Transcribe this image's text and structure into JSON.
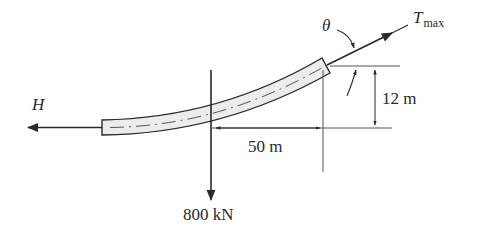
{
  "figure": {
    "type": "free-body diagram of suspended cable segment",
    "colors": {
      "line": "#2a2a2a",
      "cable_fill": "#ececec"
    }
  },
  "labels": {
    "horizontal_force": "H",
    "tension_main": "T",
    "tension_sub": "max",
    "angle": "θ",
    "weight": "800 kN",
    "horizontal_span": "50 m",
    "vertical_rise": "12 m"
  },
  "forces": [
    {
      "name": "H",
      "direction": "left",
      "description": "horizontal tension at lowest point"
    },
    {
      "name": "Tmax",
      "direction": "up-right along cable tangent",
      "description": "maximum tension at support"
    },
    {
      "name": "800 kN",
      "direction": "down",
      "description": "resultant load"
    }
  ],
  "dimensions": [
    {
      "name": "horizontal_span",
      "value": "50 m",
      "from": "load line",
      "to": "support"
    },
    {
      "name": "vertical_rise",
      "value": "12 m",
      "from": "lowest point",
      "to": "support"
    }
  ]
}
